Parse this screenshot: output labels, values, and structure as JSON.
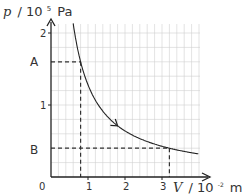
{
  "chart_data": {
    "type": "line",
    "title": "",
    "xlabel": "V / 10⁻² m³",
    "ylabel": "p / 10⁵ Pa",
    "xlabel_parts": {
      "var": "V",
      "unit": "/ 10",
      "exp": "-2",
      "unit2": "m",
      "exp2": "3"
    },
    "ylabel_parts": {
      "var": "p",
      "unit": "/ 10",
      "exp": "5",
      "unit2": "Pa"
    },
    "x_ticks": [
      "1",
      "2",
      "3"
    ],
    "x_tick_values": [
      1,
      2,
      3
    ],
    "y_ticks": [
      "1",
      "2"
    ],
    "y_tick_values": [
      1,
      2
    ],
    "origin_label": "0",
    "xlim": [
      0,
      4
    ],
    "ylim": [
      0,
      2.1
    ],
    "grid": true,
    "grid_minor_step": 0.2,
    "series": [
      {
        "name": "isotherm p·V = const",
        "x": [
          0.6,
          0.8,
          1.0,
          1.2,
          1.5,
          1.8,
          2.0,
          2.5,
          3.0,
          3.2,
          3.5,
          4.0
        ],
        "y": [
          2.13,
          1.6,
          1.28,
          1.07,
          0.85,
          0.71,
          0.64,
          0.51,
          0.43,
          0.4,
          0.37,
          0.32
        ],
        "direction_arrow_at_x": 1.8
      }
    ],
    "annotations": [
      {
        "label": "A",
        "x": 0.8,
        "y": 1.6,
        "style": "dashed-projection"
      },
      {
        "label": "B",
        "x": 3.2,
        "y": 0.4,
        "style": "dashed-projection"
      }
    ]
  },
  "labels": {
    "origin": "0",
    "x1": "1",
    "x2": "2",
    "x3": "3",
    "y1": "1",
    "y2": "2",
    "A": "A",
    "B": "B",
    "y_var": "p",
    "y_unit": "/ 10",
    "y_exp": "5",
    "y_unit2": "Pa",
    "x_var": "V",
    "x_unit": "/ 10",
    "x_exp": "-2",
    "x_unit2": "m",
    "x_exp2": "3"
  },
  "colors": {
    "axis": "#222222",
    "grid": "#d0d0d0",
    "curve": "#222222",
    "dash": "#333333"
  }
}
